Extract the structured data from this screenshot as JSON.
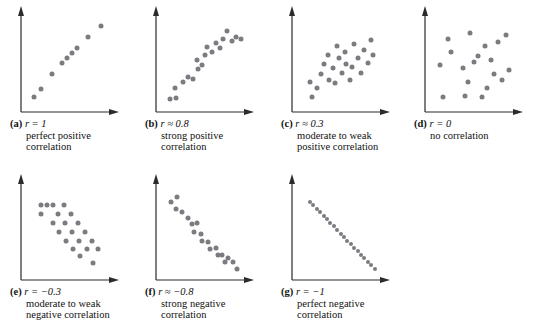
{
  "figure": {
    "type": "scatterplot-matrix",
    "dot_color": "#7b7b82",
    "axis_color": "#2b2b2b",
    "background": "#ffffff",
    "panel_count": 7
  },
  "chart_data": [
    {
      "type": "scatter",
      "panel": "a",
      "label": "(a)",
      "r_text": "r = 1",
      "r_value": 1,
      "description_line1": "perfect positive",
      "description_line2": "correlation",
      "title": "",
      "xlabel": "",
      "ylabel": "",
      "xlim": [
        0,
        100
      ],
      "ylim": [
        0,
        100
      ],
      "grid": false,
      "legend": "none",
      "x": [
        8,
        17,
        29,
        41,
        47,
        53,
        59,
        72,
        87
      ],
      "y": [
        10,
        19,
        36,
        49,
        55,
        60,
        66,
        78,
        91
      ]
    },
    {
      "type": "scatter",
      "panel": "b",
      "label": "(b)",
      "r_text": "r ≈ 0.8",
      "r_value": 0.8,
      "description_line1": "strong positive",
      "description_line2": "correlation",
      "title": "",
      "xlabel": "",
      "ylabel": "",
      "xlim": [
        0,
        100
      ],
      "ylim": [
        0,
        100
      ],
      "grid": false,
      "legend": "none",
      "x": [
        9,
        17,
        15,
        25,
        31,
        36,
        42,
        41,
        47,
        51,
        53,
        59,
        63,
        68,
        72,
        76,
        82,
        87,
        93
      ],
      "y": [
        8,
        9,
        21,
        27,
        33,
        31,
        42,
        52,
        47,
        58,
        67,
        61,
        72,
        66,
        76,
        85,
        74,
        78,
        76
      ]
    },
    {
      "type": "scatter",
      "panel": "c",
      "label": "(c)",
      "r_text": "r ≈ 0.3",
      "r_value": 0.3,
      "description_line1": "moderate to weak",
      "description_line2": "positive correlation",
      "title": "",
      "xlabel": "",
      "ylabel": "",
      "xlim": [
        0,
        100
      ],
      "ylim": [
        0,
        100
      ],
      "grid": false,
      "legend": "none",
      "x": [
        16,
        14,
        22,
        27,
        31,
        37,
        35,
        41,
        44,
        48,
        46,
        52,
        56,
        55,
        61,
        63,
        66,
        71,
        74,
        78,
        82,
        86,
        88
      ],
      "y": [
        10,
        27,
        20,
        36,
        48,
        30,
        58,
        43,
        26,
        54,
        68,
        38,
        48,
        61,
        30,
        44,
        71,
        55,
        38,
        64,
        49,
        75,
        58
      ]
    },
    {
      "type": "scatter",
      "panel": "d",
      "label": "(d)",
      "r_text": "r = 0",
      "r_value": 0,
      "description_line1": "no correlation",
      "description_line2": "",
      "title": "",
      "xlabel": "",
      "ylabel": "",
      "xlim": [
        0,
        100
      ],
      "ylim": [
        0,
        100
      ],
      "grid": false,
      "legend": "none",
      "x": [
        10,
        14,
        20,
        24,
        38,
        40,
        43,
        46,
        50,
        55,
        60,
        63,
        66,
        70,
        74,
        79,
        84,
        88,
        92
      ],
      "y": [
        47,
        10,
        76,
        61,
        43,
        11,
        27,
        83,
        50,
        57,
        10,
        68,
        21,
        52,
        36,
        73,
        29,
        81,
        41
      ]
    },
    {
      "type": "scatter",
      "panel": "e",
      "label": "(e)",
      "r_text": "r = −0.3",
      "r_value": -0.3,
      "description_line1": "moderate to weak",
      "description_line2": "negative correlation",
      "title": "",
      "xlabel": "",
      "ylabel": "",
      "xlim": [
        0,
        100
      ],
      "ylim": [
        0,
        100
      ],
      "grid": false,
      "legend": "none",
      "x": [
        16,
        16,
        24,
        30,
        30,
        37,
        38,
        44,
        45,
        46,
        52,
        53,
        54,
        60,
        61,
        62,
        68,
        70,
        76,
        78,
        84
      ],
      "y": [
        68,
        78,
        78,
        58,
        78,
        68,
        48,
        78,
        58,
        38,
        68,
        48,
        28,
        58,
        38,
        20,
        48,
        28,
        38,
        12,
        28
      ]
    },
    {
      "type": "scatter",
      "panel": "f",
      "label": "(f)",
      "r_text": "r ≈ −0.8",
      "r_value": -0.8,
      "description_line1": "strong negative",
      "description_line2": "correlation",
      "title": "",
      "xlabel": "",
      "ylabel": "",
      "xlim": [
        0,
        100
      ],
      "ylim": [
        0,
        100
      ],
      "grid": false,
      "legend": "none",
      "x": [
        11,
        18,
        17,
        24,
        30,
        35,
        41,
        38,
        46,
        47,
        54,
        57,
        63,
        66,
        70,
        74,
        78,
        84,
        88
      ],
      "y": [
        82,
        88,
        74,
        70,
        64,
        57,
        58,
        48,
        46,
        38,
        36,
        28,
        30,
        22,
        22,
        14,
        18,
        14,
        6
      ]
    },
    {
      "type": "scatter",
      "panel": "g",
      "label": "(g)",
      "r_text": "r = −1",
      "r_value": -1,
      "description_line1": "perfect negative",
      "description_line2": "correlation",
      "title": "",
      "xlabel": "",
      "ylabel": "",
      "xlim": [
        0,
        100
      ],
      "ylim": [
        0,
        100
      ],
      "grid": false,
      "legend": "none",
      "x": [
        14,
        18,
        22,
        26,
        30,
        34,
        38,
        42,
        46,
        50,
        54,
        58,
        62,
        66,
        70,
        74,
        78,
        82,
        86,
        90
      ],
      "y": [
        82,
        78,
        74,
        70,
        66,
        62,
        58,
        54,
        50,
        46,
        42,
        38,
        34,
        30,
        26,
        22,
        18,
        14,
        10,
        6
      ]
    }
  ]
}
